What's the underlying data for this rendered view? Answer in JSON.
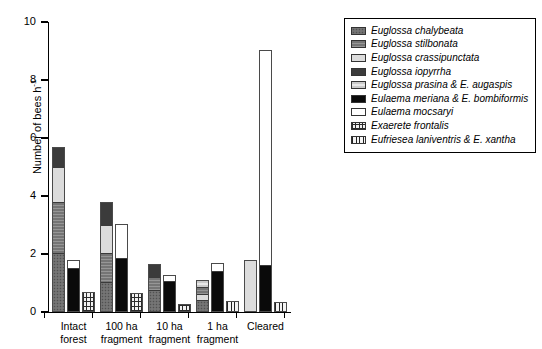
{
  "chart_data": {
    "type": "bar",
    "subtype": "stacked-grouped",
    "title": "",
    "xlabel": "",
    "ylabel": "Number of bees h",
    "ylabel_exponent": "-1",
    "ylim": [
      0,
      10
    ],
    "yticks": [
      0,
      2,
      4,
      6,
      8,
      10
    ],
    "ytick_labels": [
      "0",
      "2",
      "4",
      "6",
      "8",
      "10"
    ],
    "grid": false,
    "legend_position": "top-right outside",
    "categories": [
      "Intact forest",
      "100 ha fragment",
      "10 ha fragment",
      "1 ha fragment",
      "Cleared"
    ],
    "category_lines": [
      [
        "Intact",
        "forest"
      ],
      [
        "100 ha",
        "fragment"
      ],
      [
        "10 ha",
        "fragment"
      ],
      [
        "1 ha",
        "fragment"
      ],
      [
        "Cleared",
        ""
      ]
    ],
    "series": [
      {
        "name": "Euglossa chalybeata",
        "key": "chalybeata",
        "fill": "dotted-gray"
      },
      {
        "name": "Euglossa stilbonata",
        "key": "stilbonata",
        "fill": "medium-gray-lined"
      },
      {
        "name": "Euglossa crassipunctata",
        "key": "crassipunctata",
        "fill": "light-gray"
      },
      {
        "name": "Euglossa iopyrrha",
        "key": "iopyrrha",
        "fill": "dark-gray"
      },
      {
        "name": "Euglossa prasina & E. augaspis",
        "key": "prasina",
        "fill": "pale-gray-lined"
      },
      {
        "name": "Eulaema meriana & E. bombiformis",
        "key": "meriana",
        "fill": "black"
      },
      {
        "name": "Eulaema mocsaryi",
        "key": "mocsaryi",
        "fill": "white"
      },
      {
        "name": "Exaerete frontalis",
        "key": "frontalis",
        "fill": "cross-hatch"
      },
      {
        "name": "Eufriesea laniventris & E. xantha",
        "key": "laniventris",
        "fill": "vertical-hatch"
      }
    ],
    "groups": [
      {
        "category": "Intact forest",
        "bars": [
          {
            "total": 5.7,
            "segments": [
              {
                "key": "chalybeata",
                "value": 2.0
              },
              {
                "key": "stilbonata",
                "value": 1.78
              },
              {
                "key": "crassipunctata",
                "value": 1.22
              },
              {
                "key": "iopyrrha",
                "value": 0.7
              }
            ]
          },
          {
            "total": 1.78,
            "segments": [
              {
                "key": "meriana",
                "value": 1.5
              },
              {
                "key": "mocsaryi",
                "value": 0.28
              }
            ]
          },
          {
            "total": 0.68,
            "segments": [
              {
                "key": "frontalis",
                "value": 0.68
              }
            ]
          }
        ]
      },
      {
        "category": "100 ha fragment",
        "bars": [
          {
            "total": 3.8,
            "segments": [
              {
                "key": "chalybeata",
                "value": 1.0
              },
              {
                "key": "stilbonata",
                "value": 1.0
              },
              {
                "key": "crassipunctata",
                "value": 1.0
              },
              {
                "key": "iopyrrha",
                "value": 0.8
              }
            ]
          },
          {
            "total": 3.05,
            "segments": [
              {
                "key": "meriana",
                "value": 1.82
              },
              {
                "key": "mocsaryi",
                "value": 1.23
              }
            ]
          },
          {
            "total": 0.65,
            "segments": [
              {
                "key": "frontalis",
                "value": 0.65
              }
            ]
          }
        ]
      },
      {
        "category": "10 ha fragment",
        "bars": [
          {
            "total": 1.65,
            "segments": [
              {
                "key": "chalybeata",
                "value": 0.72
              },
              {
                "key": "stilbonata",
                "value": 0.48
              },
              {
                "key": "iopyrrha",
                "value": 0.45
              }
            ]
          },
          {
            "total": 1.28,
            "segments": [
              {
                "key": "meriana",
                "value": 1.05
              },
              {
                "key": "mocsaryi",
                "value": 0.23
              }
            ]
          },
          {
            "total": 0.28,
            "segments": [
              {
                "key": "frontalis",
                "value": 0.28
              }
            ]
          }
        ]
      },
      {
        "category": "1 ha fragment",
        "bars": [
          {
            "total": 1.1,
            "segments": [
              {
                "key": "chalybeata",
                "value": 0.38
              },
              {
                "key": "crassipunctata",
                "value": 0.22
              },
              {
                "key": "stilbonata",
                "value": 0.25
              },
              {
                "key": "prasina",
                "value": 0.25
              }
            ]
          },
          {
            "total": 1.68,
            "segments": [
              {
                "key": "meriana",
                "value": 1.42
              },
              {
                "key": "mocsaryi",
                "value": 0.26
              }
            ]
          },
          {
            "total": 0.38,
            "segments": [
              {
                "key": "laniventris",
                "value": 0.38
              }
            ]
          }
        ]
      },
      {
        "category": "Cleared",
        "bars": [
          {
            "total": 1.8,
            "segments": [
              {
                "key": "crassipunctata",
                "value": 1.8
              }
            ]
          },
          {
            "total": 9.02,
            "segments": [
              {
                "key": "meriana",
                "value": 1.55
              },
              {
                "key": "mocsaryi",
                "value": 7.47
              }
            ]
          },
          {
            "total": 0.35,
            "segments": [
              {
                "key": "laniventris",
                "value": 0.35
              }
            ]
          }
        ]
      }
    ]
  }
}
